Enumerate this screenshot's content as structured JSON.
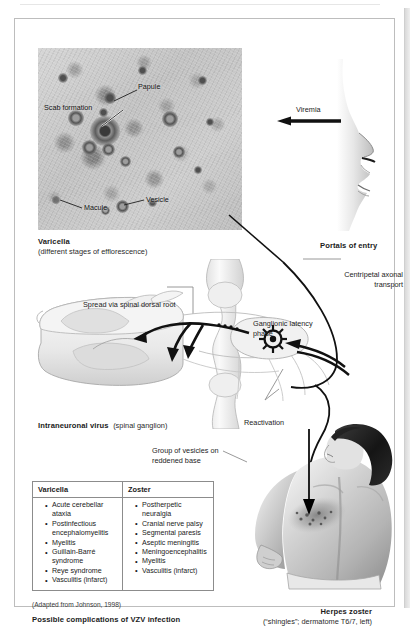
{
  "varicella_photo": {
    "labels": [
      {
        "id": "papule",
        "text": "Papule"
      },
      {
        "id": "scab",
        "text": "Scab formation"
      },
      {
        "id": "macule",
        "text": "Macule"
      },
      {
        "id": "vesicle",
        "text": "Vesicle"
      }
    ],
    "caption_title": "Varicella",
    "caption_sub": "(different stages of efflorescence)"
  },
  "entry": {
    "viremia_label": "Viremia",
    "portals_caption": "Portals of entry"
  },
  "cord": {
    "centripetal_label": "Centripetal axonal transport",
    "spread_label": "Spread via spinal dorsal root",
    "ganglionic_label": "Ganglionic latency phase",
    "reactivation_label": "Reactivation",
    "caption_title": "Intraneuronal virus",
    "caption_sub": "(spinal ganglion)"
  },
  "zoster_photo": {
    "vesicles_label": "Group of vesicles on reddened base",
    "caption_title": "Herpes zoster",
    "caption_sub": "(“shingles”; dermatome T6/7, left)"
  },
  "table": {
    "headers": [
      "Varicella",
      "Zoster"
    ],
    "varicella_items": [
      "Acute cerebellar ataxia",
      "Postinfectious encephalomyelitis",
      "Myelitis",
      "Guillain-Barré syndrome",
      "Reye syndrome",
      "Vasculitis (infarct)"
    ],
    "zoster_items": [
      "Postherpetic neuralgia",
      "Cranial nerve palsy",
      "Segmental paresis",
      "Aseptic meningitis",
      "Meningoencephalitis",
      "Myelitis",
      "Vasculitis (infarct)"
    ],
    "source_note": "(Adapted from Johnson, 1998)",
    "caption": "Possible complications of VZV infection"
  },
  "colors": {
    "frame_border": "#bdbdbd",
    "table_border": "#8c8c8c",
    "ink": "#1b1b1b",
    "arrow": "#111111"
  }
}
